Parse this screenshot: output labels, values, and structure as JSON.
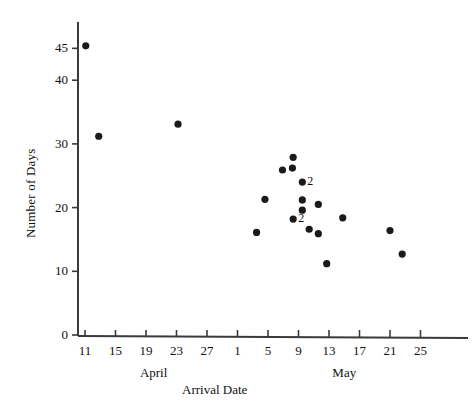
{
  "chart_data": {
    "type": "scatter",
    "title": "",
    "xlabel": "Arrival Date",
    "ylabel": "Number of Days",
    "grid": false,
    "legend": null,
    "xlim": [
      9,
      27
    ],
    "ylim": [
      0,
      48
    ],
    "y_ticks": [
      0,
      10,
      20,
      30,
      40,
      45
    ],
    "y_tick_labels": [
      "0",
      "10",
      "20",
      "30",
      "40",
      "45"
    ],
    "x_tick_labels": [
      "11",
      "15",
      "19",
      "23",
      "27",
      "1",
      "5",
      "9",
      "13",
      "17",
      "21",
      "25"
    ],
    "x_tick_values": [
      11,
      15,
      19,
      23,
      27,
      31,
      35,
      39,
      43,
      47,
      51,
      55
    ],
    "month_groups": [
      {
        "label": "April",
        "center_value": 20
      },
      {
        "label": "May",
        "center_value": 45
      }
    ],
    "point_annotations": [
      "2",
      "2"
    ],
    "points": [
      {
        "date_label": "April 11",
        "x": 11.1,
        "y": 45.4,
        "count": 1,
        "annotation": ""
      },
      {
        "date_label": "April 13",
        "x": 12.8,
        "y": 31.2,
        "count": 1,
        "annotation": ""
      },
      {
        "date_label": "April 23",
        "x": 23.2,
        "y": 33.1,
        "count": 1,
        "annotation": ""
      },
      {
        "date_label": "May 8",
        "x": 38.3,
        "y": 27.9,
        "count": 1,
        "annotation": ""
      },
      {
        "date_label": "May 6",
        "x": 36.9,
        "y": 25.9,
        "count": 1,
        "annotation": ""
      },
      {
        "date_label": "May 8",
        "x": 38.2,
        "y": 26.2,
        "count": 1,
        "annotation": ""
      },
      {
        "date_label": "May 9",
        "x": 39.5,
        "y": 24.0,
        "count": 2,
        "annotation": "2"
      },
      {
        "date_label": "May 4",
        "x": 34.6,
        "y": 21.3,
        "count": 1,
        "annotation": ""
      },
      {
        "date_label": "May 9",
        "x": 39.5,
        "y": 21.2,
        "count": 1,
        "annotation": ""
      },
      {
        "date_label": "May 9",
        "x": 39.5,
        "y": 19.6,
        "count": 1,
        "annotation": ""
      },
      {
        "date_label": "May 8",
        "x": 38.3,
        "y": 18.2,
        "count": 2,
        "annotation": "2"
      },
      {
        "date_label": "May 11",
        "x": 41.6,
        "y": 20.5,
        "count": 1,
        "annotation": ""
      },
      {
        "date_label": "May 14",
        "x": 44.8,
        "y": 18.4,
        "count": 1,
        "annotation": ""
      },
      {
        "date_label": "May 10",
        "x": 40.4,
        "y": 16.6,
        "count": 1,
        "annotation": ""
      },
      {
        "date_label": "May 12",
        "x": 41.6,
        "y": 15.9,
        "count": 1,
        "annotation": ""
      },
      {
        "date_label": "May 3",
        "x": 33.5,
        "y": 16.1,
        "count": 1,
        "annotation": ""
      },
      {
        "date_label": "May 12",
        "x": 42.7,
        "y": 11.2,
        "count": 1,
        "annotation": ""
      },
      {
        "date_label": "May 21",
        "x": 51.0,
        "y": 16.4,
        "count": 1,
        "annotation": ""
      },
      {
        "date_label": "May 22",
        "x": 52.6,
        "y": 12.7,
        "count": 1,
        "annotation": ""
      }
    ]
  },
  "axis": {
    "y_title": "Number of Days",
    "x_title": "Arrival Date",
    "y_tick_labels": [
      "45",
      "40",
      "30",
      "20",
      "10",
      "0"
    ],
    "x_tick_labels": [
      "11",
      "15",
      "19",
      "23",
      "27",
      "1",
      "5",
      "9",
      "13",
      "17",
      "21",
      "25"
    ],
    "months": [
      "April",
      "May"
    ]
  },
  "style": {
    "axis_color": "#3a3a3a",
    "point_color": "#1a1a1a",
    "background": "#ffffff"
  }
}
